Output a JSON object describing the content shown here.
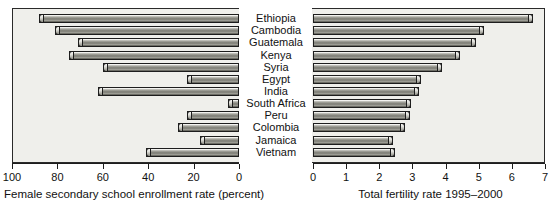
{
  "chart_data": [
    {
      "type": "bar",
      "orientation": "horizontal-reversed",
      "title": "",
      "xlabel": "Female secondary school enrollment rate (percent)",
      "ylabel": "",
      "categories": [
        "Ethiopia",
        "Cambodia",
        "Guatemala",
        "Kenya",
        "Syria",
        "Egypt",
        "India",
        "South Africa",
        "Peru",
        "Colombia",
        "Jamaica",
        "Vietnam"
      ],
      "values": [
        12,
        19,
        29,
        25,
        40,
        77,
        38,
        95,
        77,
        73,
        83,
        59
      ],
      "xlim": [
        100,
        0
      ],
      "xticks": [
        100,
        80,
        60,
        40,
        20,
        0
      ],
      "xticklabels": [
        "100",
        "80",
        "60",
        "40",
        "20",
        "0"
      ],
      "grid": false,
      "legend": null
    },
    {
      "type": "bar",
      "orientation": "horizontal",
      "title": "",
      "xlabel": "Total fertility rate 1995–2000",
      "ylabel": "",
      "categories": [
        "Ethiopia",
        "Cambodia",
        "Guatemala",
        "Kenya",
        "Syria",
        "Egypt",
        "India",
        "South Africa",
        "Peru",
        "Colombia",
        "Jamaica",
        "Vietnam"
      ],
      "values": [
        6.65,
        5.17,
        4.93,
        4.45,
        3.9,
        3.26,
        3.2,
        2.96,
        2.93,
        2.78,
        2.41,
        2.47
      ],
      "xlim": [
        0,
        7
      ],
      "xticks": [
        0,
        1,
        2,
        3,
        4,
        5,
        6,
        7
      ],
      "xticklabels": [
        "0",
        "1",
        "2",
        "3",
        "4",
        "5",
        "6",
        "7"
      ],
      "grid": false,
      "legend": null
    }
  ],
  "left_panel": {
    "axis_title": "Female secondary school enrollment rate (percent)",
    "tick_labels": [
      "100",
      "80",
      "60",
      "40",
      "20",
      "0"
    ]
  },
  "center_panel": {
    "categories": [
      "Ethiopia",
      "Cambodia",
      "Guatemala",
      "Kenya",
      "Syria",
      "Egypt",
      "India",
      "South Africa",
      "Peru",
      "Colombia",
      "Jamaica",
      "Vietnam"
    ]
  },
  "right_panel": {
    "axis_title": "Total fertility rate 1995–2000",
    "tick_labels": [
      "0",
      "1",
      "2",
      "3",
      "4",
      "5",
      "6",
      "7"
    ]
  },
  "colors": {
    "plot_background": "#efefeb",
    "bar_fill": "#8e8e86",
    "axis": "#1d1d1d",
    "text": "#111111"
  }
}
